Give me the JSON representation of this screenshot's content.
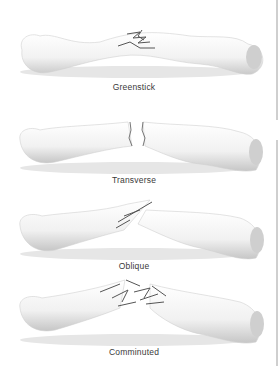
{
  "figure": {
    "panels": [
      {
        "id": "greenstick",
        "label": "Greenstick",
        "top": 2,
        "label_top": 82
      },
      {
        "id": "transverse",
        "label": "Transverse",
        "top": 96,
        "label_top": 175
      },
      {
        "id": "oblique",
        "label": "Oblique",
        "top": 182,
        "label_top": 261
      },
      {
        "id": "comminuted",
        "label": "Comminuted",
        "top": 268,
        "label_top": 347
      }
    ]
  },
  "colors": {
    "bone_fill": "#f4f4f4",
    "bone_shadow": "#c8c8c8",
    "crack": "#555555",
    "label_text": "#3a3a3a",
    "edge_bar": "#cfcfcf"
  }
}
